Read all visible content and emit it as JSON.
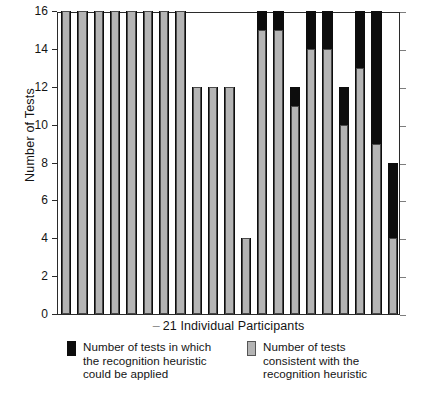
{
  "chart_data": {
    "type": "bar",
    "title": "",
    "subtitle": "",
    "xlabel": "21 Individual Participants",
    "ylabel": "Number of Tests",
    "ylim": [
      0,
      16
    ],
    "xlim": [
      0,
      21
    ],
    "ytick_labels": [
      "0",
      "2",
      "4",
      "6",
      "8",
      "10",
      "12",
      "14",
      "16"
    ],
    "ytick_values": [
      0,
      2,
      4,
      6,
      8,
      10,
      12,
      14,
      16
    ],
    "grid": false,
    "legend_position": "below-axes",
    "categories": [
      "1",
      "2",
      "3",
      "4",
      "5",
      "6",
      "7",
      "8",
      "9",
      "10",
      "11",
      "12",
      "13",
      "14",
      "15",
      "16",
      "17",
      "18",
      "19",
      "20",
      "21"
    ],
    "series": [
      {
        "name": "Number of tests in which the recognition heuristic could be applied",
        "color": "#0d0d0d",
        "values": [
          16,
          16,
          16,
          16,
          16,
          16,
          16,
          16,
          12,
          12,
          12,
          4,
          16,
          16,
          12,
          16,
          16,
          12,
          16,
          16,
          8
        ]
      },
      {
        "name": "Number of tests consistent with the recognition heuristic",
        "color": "#b4b4b4",
        "values": [
          16,
          16,
          16,
          16,
          16,
          16,
          16,
          16,
          12,
          12,
          12,
          4,
          15,
          15,
          11,
          14,
          14,
          10,
          13,
          9,
          4
        ]
      }
    ]
  },
  "axes": {
    "y_title": "Number of Tests",
    "x_title": "21 Individual Participants",
    "x_title_dash": "–"
  },
  "legend": {
    "items": [
      {
        "swatch": "black",
        "line1": "Number of tests in which",
        "line2": "the recognition heuristic",
        "line3": "could be applied"
      },
      {
        "swatch": "gray",
        "line1": "Number of tests",
        "line2": "consistent with the",
        "line3": "recognition heuristic"
      }
    ]
  }
}
